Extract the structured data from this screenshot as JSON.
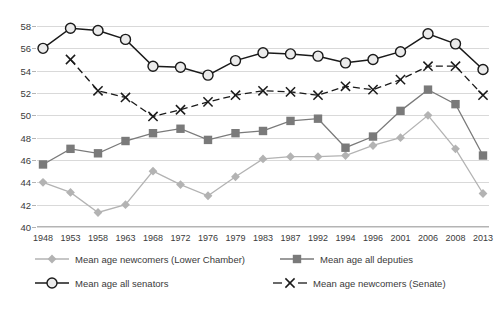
{
  "chart_data": {
    "type": "line",
    "title": "",
    "subtitle": "",
    "xlabel": "",
    "ylabel": "",
    "grid": true,
    "legend_position": "bottom",
    "ylim": [
      40,
      58
    ],
    "yticks": [
      40,
      42,
      44,
      46,
      48,
      50,
      52,
      54,
      56,
      58
    ],
    "categories": [
      "1948",
      "1953",
      "1958",
      "1963",
      "1968",
      "1972",
      "1976",
      "1979",
      "1983",
      "1987",
      "1992",
      "1994",
      "1996",
      "2001",
      "2006",
      "2008",
      "2013"
    ],
    "x": [
      "1948",
      "1953",
      "1958",
      "1963",
      "1968",
      "1972",
      "1976",
      "1979",
      "1983",
      "1987",
      "1992",
      "1994",
      "1996",
      "2001",
      "2006",
      "2008",
      "2013"
    ],
    "series": [
      {
        "name": "Mean age newcomers (Lower Chamber)",
        "marker": "diamond",
        "color": "#b3b3b3",
        "line_style": "solid",
        "values": [
          44.0,
          43.1,
          41.3,
          42.0,
          45.0,
          43.8,
          42.8,
          44.5,
          46.1,
          46.3,
          46.3,
          46.4,
          47.3,
          48.0,
          50.0,
          47.0,
          43.0
        ]
      },
      {
        "name": "Mean age all deputies",
        "marker": "square",
        "color": "#7a7a7a",
        "line_style": "solid",
        "values": [
          45.6,
          47.0,
          46.6,
          47.7,
          48.4,
          48.8,
          47.8,
          48.4,
          48.6,
          49.5,
          49.7,
          47.1,
          48.1,
          50.4,
          52.3,
          51.0,
          46.4
        ]
      },
      {
        "name": "Mean age all senators",
        "marker": "circle-open",
        "color": "#1a1a1a",
        "line_style": "solid",
        "values": [
          56.0,
          57.8,
          57.6,
          56.8,
          54.4,
          54.3,
          53.6,
          54.9,
          55.6,
          55.5,
          55.3,
          54.7,
          55.0,
          55.7,
          57.3,
          56.4,
          54.1
        ]
      },
      {
        "name": "Mean age newcomers (Senate)",
        "marker": "cross",
        "color": "#1a1a1a",
        "line_style": "dashed",
        "values": [
          null,
          55.0,
          52.2,
          51.6,
          49.9,
          50.5,
          51.2,
          51.8,
          52.2,
          52.1,
          51.8,
          52.6,
          52.3,
          53.2,
          54.4,
          54.4,
          51.8
        ]
      }
    ]
  },
  "legend": {
    "items": [
      {
        "label": "Mean age newcomers (Lower Chamber)"
      },
      {
        "label": "Mean age all deputies"
      },
      {
        "label": "Mean age all senators"
      },
      {
        "label": "Mean age newcomers (Senate)"
      }
    ]
  }
}
